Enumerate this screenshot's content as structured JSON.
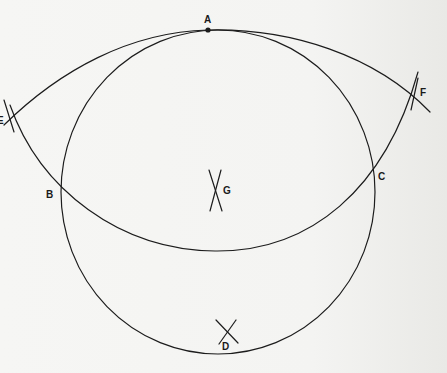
{
  "diagram": {
    "type": "geometric-construction",
    "stroke_color": "#1c1c1c",
    "background_color": "#f4f4f2",
    "points": [
      {
        "id": "A",
        "label": "A",
        "x": 208,
        "y": 30
      },
      {
        "id": "B",
        "label": "B",
        "x": 61,
        "y": 193
      },
      {
        "id": "C",
        "label": "C",
        "x": 373,
        "y": 180
      },
      {
        "id": "D",
        "label": "D",
        "x": 226,
        "y": 332
      },
      {
        "id": "E",
        "label": "E",
        "x": 8,
        "y": 122
      },
      {
        "id": "F",
        "label": "F",
        "x": 415,
        "y": 92
      },
      {
        "id": "G",
        "label": "G",
        "x": 216,
        "y": 188
      }
    ],
    "shapes": [
      {
        "kind": "circle",
        "center": [
          218,
          192
        ],
        "r": 160,
        "passes_through": [
          "A",
          "B",
          "C"
        ]
      },
      {
        "kind": "arc",
        "through": [
          "E",
          "A",
          "F"
        ],
        "note": "upper arc tangent to circle at A"
      },
      {
        "kind": "arc",
        "through": [
          "E",
          "B",
          "C",
          "F"
        ],
        "note": "lower arc"
      },
      {
        "kind": "cross-mark",
        "at": "G"
      },
      {
        "kind": "cross-mark",
        "at": "D"
      }
    ]
  }
}
